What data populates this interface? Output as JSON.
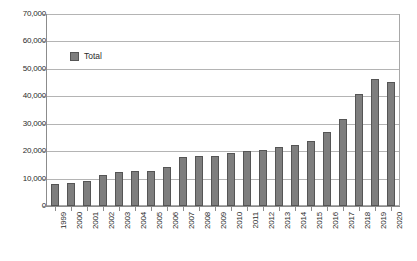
{
  "chart_data": {
    "type": "bar",
    "title": "",
    "xlabel": "",
    "ylabel": "",
    "grid": true,
    "legend_position": "inside-top-left",
    "ylim": [
      0,
      70000
    ],
    "ytick_step": 10000,
    "ytick_labels": [
      "0",
      "10,000",
      "20,000",
      "30,000",
      "40,000",
      "50,000",
      "60,000",
      "70,000"
    ],
    "ytick_values": [
      0,
      10000,
      20000,
      30000,
      40000,
      50000,
      60000,
      70000
    ],
    "categories": [
      "1999",
      "2000",
      "2001",
      "2002",
      "2003",
      "2004",
      "2005",
      "2006",
      "2007",
      "2008",
      "2009",
      "2010",
      "2011",
      "2012",
      "2013",
      "2014",
      "2015",
      "2016",
      "2017",
      "2018",
      "2019",
      "2020"
    ],
    "series": [
      {
        "name": "Total",
        "color": "#7e7e7e",
        "values": [
          8200,
          8300,
          9200,
          11500,
          12500,
          12700,
          13000,
          14200,
          17800,
          18300,
          18500,
          19600,
          20200,
          20600,
          21500,
          22400,
          24000,
          27000,
          32000,
          41000,
          46500,
          45500
        ]
      }
    ]
  },
  "chart_values_display": {
    "v1999": 8200,
    "v2000": 8300,
    "v2001": 9200,
    "v2002": 11500,
    "v2003": 12500,
    "v2004": 12700,
    "v2005": 13000,
    "v2006": 14200,
    "v2007": 17800,
    "v2008": 18300,
    "v2009": 18500,
    "v2010": 19600,
    "v2011": 20200,
    "v2012": 20600,
    "v2013": 21500,
    "v2014": 22400,
    "v2015": 24000,
    "v2016": 27000,
    "v2017": 32000,
    "v2018": 41000,
    "v2019": 46500,
    "v2020": 45500
  },
  "legend": {
    "items": [
      {
        "label": "Total",
        "color": "#7e7e7e"
      }
    ]
  },
  "axes": {
    "y": {
      "ticks": [
        {
          "label": "70,000",
          "value": 70000
        },
        {
          "label": "60,000",
          "value": 60000
        },
        {
          "label": "50,000",
          "value": 50000
        },
        {
          "label": "40,000",
          "value": 40000
        },
        {
          "label": "30,000",
          "value": 30000
        },
        {
          "label": "20,000",
          "value": 20000
        },
        {
          "label": "10,000",
          "value": 10000
        },
        {
          "label": "0",
          "value": 0
        }
      ]
    },
    "x": {
      "ticks": [
        {
          "label": "1999"
        },
        {
          "label": "2000"
        },
        {
          "label": "2001"
        },
        {
          "label": "2002"
        },
        {
          "label": "2003"
        },
        {
          "label": "2004"
        },
        {
          "label": "2005"
        },
        {
          "label": "2006"
        },
        {
          "label": "2007"
        },
        {
          "label": "2008"
        },
        {
          "label": "2009"
        },
        {
          "label": "2010"
        },
        {
          "label": "2011"
        },
        {
          "label": "2012"
        },
        {
          "label": "2013"
        },
        {
          "label": "2014"
        },
        {
          "label": "2015"
        },
        {
          "label": "2016"
        },
        {
          "label": "2017"
        },
        {
          "label": "2018"
        },
        {
          "label": "2019"
        },
        {
          "label": "2020"
        }
      ]
    }
  },
  "style": {
    "bar_fill": "#7e7e7e",
    "bar_stroke": "#555555",
    "gridline_color": "#b4b4b4",
    "axis_color": "#8c8c8c",
    "text_color": "#2b2b2b",
    "background": "#ffffff"
  }
}
